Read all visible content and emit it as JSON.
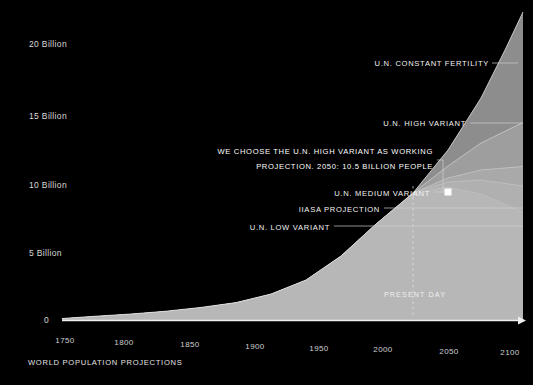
{
  "caption": "WORLD POPULATION PROJECTIONS",
  "present_day_label": "PRESENT DAY",
  "colors": {
    "background": "#000000",
    "axis": "#e8e8e8",
    "text": "#ffffff",
    "band_constant_fertility": "#8d8d8d",
    "band_high_variant": "#9e9e9e",
    "band_medium_variant": "#a9a9a9",
    "band_iiasa": "#b0b0b0",
    "band_low_variant": "#b7b7b7",
    "marker": "#ffffff",
    "leader_line": "#cfcfcf"
  },
  "chart_data": {
    "type": "area",
    "title": "WORLD POPULATION PROJECTIONS",
    "xlabel": "",
    "ylabel": "",
    "xlim": [
      1750,
      2100
    ],
    "ylim": [
      0,
      21.5
    ],
    "grid": false,
    "legend_position": "inline-annotations",
    "xticks": [
      "1750",
      "1800",
      "1850",
      "1900",
      "1950",
      "2000",
      "2050",
      "2100"
    ],
    "xtick_values": [
      1750,
      1800,
      1850,
      1900,
      1950,
      2000,
      2050,
      2100
    ],
    "yticks": [
      "0",
      "5 Billion",
      "10 Billion",
      "15 Billion",
      "20 Billion"
    ],
    "ytick_values": [
      0,
      5,
      10,
      15,
      20
    ],
    "annotations": [
      {
        "name": "constant-fertility",
        "label": "U.N. CONSTANT FERTILITY",
        "label_x": 489,
        "label_y": 63,
        "leader_from_x": 492,
        "leader_to_x": 517,
        "leader_y": 63
      },
      {
        "name": "high-variant",
        "label": "U.N. HIGH VARIANT",
        "label_x": 466,
        "label_y": 123,
        "leader_from_x": 470,
        "leader_to_x": 523,
        "leader_y": 123
      },
      {
        "name": "working-projection",
        "label_line1": "WE CHOOSE THE U.N. HIGH VARIANT AS WORKING",
        "label_line2": "PROJECTION. 2050: 10.5 BILLION PEOPLE",
        "label_x": 433,
        "label_y": 149,
        "leader_elbow_x": 440,
        "leader_top_y": 160,
        "leader_bottom_y": 191,
        "leader_to_x": 447
      },
      {
        "name": "medium-variant",
        "label": "U.N. MEDIUM VARIANT",
        "label_x": 430,
        "label_y": 196,
        "leader_from_x": 434,
        "leader_to_x": 446,
        "leader_y": 192
      },
      {
        "name": "iiasa-projection",
        "label": "IIASA PROJECTION",
        "label_x": 380,
        "label_y": 211,
        "leader_from_x": 384,
        "leader_to_x": 523,
        "leader_y": 208
      },
      {
        "name": "low-variant",
        "label": "U.N. LOW VARIANT",
        "label_x": 330,
        "label_y": 229,
        "leader_from_x": 334,
        "leader_to_x": 523,
        "leader_y": 226
      }
    ],
    "series": [
      {
        "name": "U.N. CONSTANT FERTILITY",
        "values_note": "upper envelope, billions",
        "x": [
          1750,
          1800,
          1850,
          1900,
          1950,
          2000,
          2023,
          2050,
          2075,
          2100
        ],
        "values": [
          0.79,
          0.98,
          1.26,
          1.65,
          2.54,
          6.14,
          8.0,
          10.6,
          15.0,
          21.2
        ]
      },
      {
        "name": "U.N. HIGH VARIANT",
        "x": [
          1750,
          1800,
          1850,
          1900,
          1950,
          2000,
          2023,
          2050,
          2075,
          2100
        ],
        "values": [
          0.79,
          0.98,
          1.26,
          1.65,
          2.54,
          6.14,
          8.0,
          10.5,
          13.0,
          15.0
        ]
      },
      {
        "name": "U.N. MEDIUM VARIANT",
        "x": [
          1750,
          1800,
          1850,
          1900,
          1950,
          2000,
          2023,
          2050,
          2075,
          2100
        ],
        "values": [
          0.79,
          0.98,
          1.26,
          1.65,
          2.54,
          6.14,
          8.0,
          9.7,
          10.5,
          10.9
        ]
      },
      {
        "name": "IIASA PROJECTION",
        "x": [
          1750,
          1800,
          1850,
          1900,
          1950,
          2000,
          2023,
          2050,
          2075,
          2100
        ],
        "values": [
          0.79,
          0.98,
          1.26,
          1.65,
          2.54,
          6.14,
          8.0,
          9.4,
          9.7,
          9.3
        ]
      },
      {
        "name": "U.N. LOW VARIANT",
        "x": [
          1750,
          1800,
          1850,
          1900,
          1950,
          2000,
          2023,
          2050,
          2075,
          2100
        ],
        "values": [
          0.79,
          0.98,
          1.26,
          1.65,
          2.54,
          6.14,
          8.0,
          8.9,
          8.4,
          7.3
        ]
      }
    ],
    "marker": {
      "label": "2050: 10.5 Billion People",
      "x_value": 2050,
      "y_value": 10.5,
      "px_x": 448,
      "px_y": 192
    },
    "present_day": {
      "x_value": 2023,
      "px_x": 413
    }
  }
}
